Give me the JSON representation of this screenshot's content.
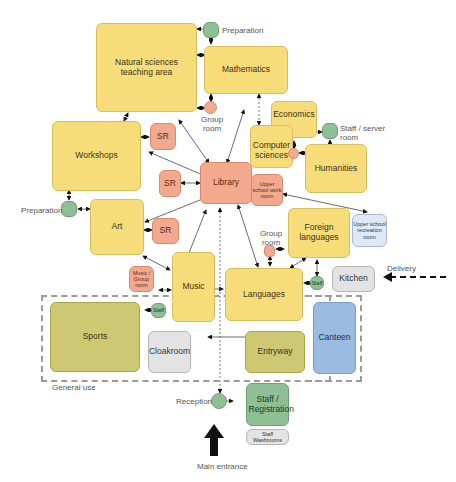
{
  "diagram": {
    "colors": {
      "teaching": "#f7dc7a",
      "support": "#f3a98e",
      "staff": "#8fbf95",
      "general": "#cdc871",
      "service": "#e3e3e3",
      "canteen": "#9bbbe3",
      "recreation": "#dde9f6"
    },
    "rooms": {
      "natural_sciences": "Natural sciences teaching area",
      "preparation_top": "Preparation",
      "mathematics": "Mathematics",
      "group_room_top": "Group room",
      "economics": "Economics",
      "computer_sciences": "Computer sciences",
      "staff_server": "Staff / server room",
      "humanities": "Humanities",
      "workshops": "Workshops",
      "sr1": "SR",
      "sr2": "SR",
      "sr3": "SR",
      "library": "Library",
      "upper_school_work": "Upper school work room",
      "preparation_left": "Preparation",
      "art": "Art",
      "upper_school_recreation": "Upper school recreation room",
      "foreign_languages": "Foreign languages",
      "group_room_mid": "Group room",
      "music_group": "Music / Group room",
      "music": "Music",
      "languages": "Languages",
      "staff_small_right": "Staff",
      "kitchen": "Kitchen",
      "delivery": "Delivery",
      "staff_small_left": "Staff",
      "sports": "Sports",
      "cloakroom": "Cloakroom",
      "entryway": "Entryway",
      "canteen": "Canteen",
      "general_use": "General use",
      "reception": "Reception",
      "staff_registration": "Staff / Registration",
      "staff_washrooms": "Staff Washrooms",
      "main_entrance": "Main entrance"
    }
  }
}
